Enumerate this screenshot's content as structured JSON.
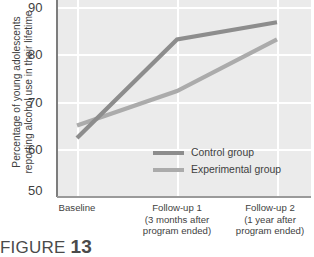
{
  "chart_data": {
    "type": "line",
    "title": "",
    "xlabel": "",
    "ylabel": "Percentage of young adolescents reporting alcohol use in their lifetime",
    "ylabel_line1": "Percentage of young adolescents",
    "ylabel_line2": "reporting alcohol use in their lifetime",
    "categories": [
      "Baseline",
      "Follow-up 1",
      "Follow-up 2"
    ],
    "category_sublabels": [
      [
        "Baseline"
      ],
      [
        "Follow-up 1",
        "(3 months after",
        "program ended)"
      ],
      [
        "Follow-up 2",
        "(1 year after",
        "program ended)"
      ]
    ],
    "ylim": [
      50,
      90
    ],
    "yticks": [
      90,
      80,
      70,
      60,
      50
    ],
    "ytick_labels": [
      "90",
      "80",
      "70",
      "60",
      "50"
    ],
    "grid": true,
    "legend_position": "inside-lower-center",
    "series": [
      {
        "name": "Control group",
        "color": "#8d8d8d",
        "values": [
          62.0,
          82.0,
          85.5
        ]
      },
      {
        "name": "Experimental group",
        "color": "#ababab",
        "values": [
          64.5,
          71.5,
          82.0
        ]
      }
    ]
  },
  "legend": {
    "items": [
      {
        "label": "Control group",
        "color": "#8d8d8d"
      },
      {
        "label": "Experimental group",
        "color": "#ababab"
      }
    ]
  },
  "caption": {
    "word": "FIGURE",
    "number": "13"
  },
  "colors": {
    "plot_background": "#ebebeb",
    "gridline": "#ffffff",
    "axis": "#9a9a9a",
    "text": "#3f3f3f",
    "control_line": "#8d8d8d",
    "experimental_line": "#ababab"
  }
}
